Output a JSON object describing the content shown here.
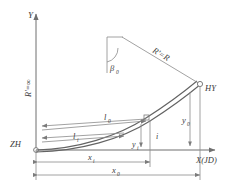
{
  "diagram": {
    "axes": {
      "y_label": "Y",
      "x_label": "X(JD)",
      "origin_label": "ZH"
    },
    "labels": {
      "radius_infinite": "R'=∞",
      "radius_equal": "R'=R",
      "angle_beta0": "β",
      "angle_beta0_sub": "0",
      "point_hy": "HY",
      "l_zero": "l",
      "l_zero_sub": "0",
      "l_i": "l",
      "l_i_sub": "i",
      "y_zero": "y",
      "y_zero_sub": "0",
      "y_i": "y",
      "y_i_sub": "i",
      "x_i": "x",
      "x_i_sub": "i",
      "x_zero": "x",
      "x_zero_sub": "0",
      "point_i": "i"
    },
    "colors": {
      "line": "#6f6f6f",
      "thin_line": "#8a8a8a",
      "curve": "#636363",
      "text": "#3a3a3a",
      "background": "#ffffff"
    }
  }
}
